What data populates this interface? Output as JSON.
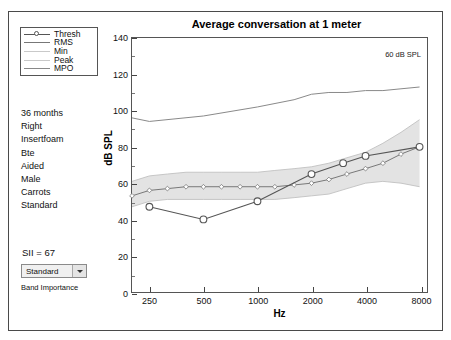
{
  "window": {
    "title": "Average conversation at 1 meter"
  },
  "legend": {
    "items": [
      {
        "label": "Thresh",
        "marker": "circle-line",
        "color": "#555555"
      },
      {
        "label": "RMS",
        "marker": "line",
        "color": "#777777"
      },
      {
        "label": "Min",
        "marker": "line",
        "color": "#c9c9c9"
      },
      {
        "label": "Peak",
        "marker": "line",
        "color": "#c9c9c9"
      },
      {
        "label": "MPO",
        "marker": "line",
        "color": "#888888"
      }
    ]
  },
  "patient_info": {
    "lines": [
      "36 months",
      "Right",
      "Insertfoam",
      "Bte",
      "Aided",
      "Male",
      "Carrots",
      "Standard"
    ]
  },
  "sii": {
    "text": "SII = 67",
    "value": 67
  },
  "band_importance": {
    "selected": "Standard",
    "label": "Band Importance",
    "options": [
      "Standard"
    ],
    "arrow_icon": "chevron-down-icon"
  },
  "chart_data": {
    "type": "line",
    "title": "Average conversation at 1 meter",
    "annotation": "60 dB SPL",
    "xlabel": "Hz",
    "ylabel": "dB SPL",
    "xscale": "log",
    "xlim": [
      200,
      8800
    ],
    "ylim": [
      0,
      140
    ],
    "yticks": [
      0,
      20,
      40,
      60,
      80,
      100,
      120,
      140
    ],
    "yticks_minor": [
      10,
      30,
      50,
      70,
      90,
      110,
      130
    ],
    "xticks": [
      250,
      500,
      1000,
      2000,
      4000,
      8000
    ],
    "xtick_labels": [
      "250",
      "500",
      "1000",
      "2000",
      "4000",
      "8000"
    ],
    "grid": false,
    "legend_position": "outside-left",
    "x": [
      200,
      250,
      315,
      400,
      500,
      630,
      800,
      1000,
      1250,
      1600,
      2000,
      2500,
      3150,
      4000,
      5000,
      6300,
      8000
    ],
    "series": [
      {
        "name": "Thresh",
        "color": "#555555",
        "marker": "circle",
        "x": [
          250,
          500,
          1000,
          2000,
          3000,
          4000,
          8000
        ],
        "values": [
          47,
          40,
          50,
          65,
          71,
          75,
          80
        ]
      },
      {
        "name": "RMS",
        "color": "#777777",
        "marker": "diamond",
        "x": [
          200,
          250,
          315,
          400,
          500,
          630,
          800,
          1000,
          1250,
          1600,
          2000,
          2500,
          3150,
          4000,
          5000,
          6300,
          8000
        ],
        "values": [
          53,
          56,
          57,
          58,
          58,
          58,
          58,
          58,
          58,
          59,
          60,
          62,
          65,
          68,
          71,
          76,
          80
        ]
      },
      {
        "name": "Peak",
        "color": "#c0c0c0",
        "marker": "none",
        "x": [
          200,
          250,
          315,
          400,
          500,
          630,
          800,
          1000,
          1250,
          1600,
          2000,
          2500,
          3150,
          4000,
          5000,
          6300,
          8000
        ],
        "values": [
          61,
          64,
          65,
          66,
          66,
          66,
          66,
          66,
          67,
          68,
          69,
          71,
          74,
          77,
          82,
          88,
          95
        ]
      },
      {
        "name": "Min",
        "color": "#c0c0c0",
        "marker": "none",
        "x": [
          200,
          250,
          315,
          400,
          500,
          630,
          800,
          1000,
          1250,
          1600,
          2000,
          2500,
          3150,
          4000,
          5000,
          6300,
          8000
        ],
        "values": [
          47,
          50,
          51,
          51,
          51,
          51,
          51,
          51,
          51,
          52,
          53,
          54,
          57,
          60,
          61,
          60,
          58
        ]
      },
      {
        "name": "MPO",
        "color": "#888888",
        "marker": "none",
        "x": [
          200,
          250,
          500,
          1000,
          1600,
          2000,
          2500,
          3150,
          4000,
          5000,
          6300,
          8000
        ],
        "values": [
          96,
          94,
          97,
          102,
          106,
          109,
          110,
          110,
          111,
          111,
          112,
          113
        ]
      }
    ]
  }
}
